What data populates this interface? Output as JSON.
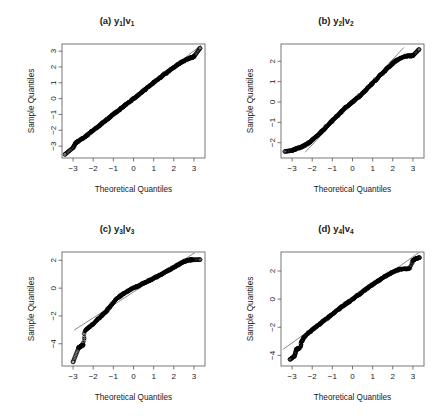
{
  "figure": {
    "title": "",
    "background": "#ffffff",
    "panel_count": 4,
    "shared_xlabel": "Theoretical Quantiles",
    "shared_ylabel": "Sample Quantiles"
  },
  "chart_data": [
    {
      "type": "scatter",
      "id": "a",
      "title": "(a) y1|v1",
      "title_main": "(a) y",
      "title_sub1": "1",
      "title_mid": "|v",
      "title_sub2": "1",
      "xlabel": "Theoretical Quantiles",
      "ylabel": "Sample Quantiles",
      "xlim": [
        -3.55,
        3.55
      ],
      "ylim": [
        -3.75,
        3.45
      ],
      "xticks": [
        -3,
        -2,
        -1,
        0,
        1,
        2,
        3
      ],
      "xticklabels": [
        "-3",
        "-2",
        "-1",
        "0",
        "1",
        "2",
        "3"
      ],
      "yticks": [
        -3,
        -2,
        -1,
        0,
        1,
        2,
        3
      ],
      "yticklabels": [
        "-3",
        "-2",
        "-1",
        "0",
        "1",
        "2",
        "3"
      ],
      "grid": false,
      "legend": false,
      "reference_line": {
        "slope": 1.0,
        "intercept": 0.02,
        "x0": -3.4,
        "x1": 3.35
      },
      "shape": "near-normal",
      "n_points": 600,
      "x": [
        -3.4,
        -3.0,
        -2.86,
        -2.78,
        -2.72,
        -2.6,
        -2.5,
        -2.4,
        -2.3,
        -2.2,
        -2.1,
        -2.0,
        -1.9,
        -1.8,
        -1.7,
        -1.6,
        -1.5,
        -1.4,
        -1.3,
        -1.2,
        -1.1,
        -1.0,
        -0.9,
        -0.8,
        -0.7,
        -0.6,
        -0.5,
        -0.4,
        -0.3,
        -0.2,
        -0.1,
        0.0,
        0.1,
        0.2,
        0.3,
        0.4,
        0.5,
        0.6,
        0.7,
        0.8,
        0.9,
        1.0,
        1.1,
        1.2,
        1.3,
        1.4,
        1.5,
        1.6,
        1.7,
        1.8,
        1.9,
        2.0,
        2.1,
        2.2,
        2.3,
        2.4,
        2.5,
        2.62,
        2.72,
        2.8,
        2.9,
        3.0,
        3.3
      ],
      "y": [
        -3.52,
        -3.1,
        -2.78,
        -2.72,
        -2.66,
        -2.58,
        -2.5,
        -2.4,
        -2.3,
        -2.2,
        -2.1,
        -2.0,
        -1.9,
        -1.8,
        -1.7,
        -1.6,
        -1.5,
        -1.4,
        -1.3,
        -1.2,
        -1.1,
        -1.0,
        -0.9,
        -0.8,
        -0.7,
        -0.6,
        -0.5,
        -0.4,
        -0.3,
        -0.2,
        -0.1,
        0.0,
        0.1,
        0.2,
        0.3,
        0.4,
        0.5,
        0.6,
        0.7,
        0.8,
        0.9,
        1.0,
        1.1,
        1.2,
        1.3,
        1.4,
        1.5,
        1.6,
        1.7,
        1.79,
        1.88,
        1.97,
        2.06,
        2.15,
        2.23,
        2.31,
        2.38,
        2.46,
        2.52,
        2.56,
        2.6,
        2.65,
        3.18
      ]
    },
    {
      "type": "scatter",
      "id": "b",
      "title": "(b) y2|v2",
      "title_main": "(b) y",
      "title_sub1": "2",
      "title_mid": "|v",
      "title_sub2": "2",
      "xlabel": "Theoretical Quantiles",
      "ylabel": "Sample Quantiles",
      "xlim": [
        -3.55,
        3.55
      ],
      "ylim": [
        -2.75,
        2.85
      ],
      "xticks": [
        -3,
        -2,
        -1,
        0,
        1,
        2,
        3
      ],
      "xticklabels": [
        "-3",
        "-2",
        "-1",
        "0",
        "1",
        "2",
        "3"
      ],
      "yticks": [
        -2,
        -1,
        0,
        1,
        2
      ],
      "yticklabels": [
        "-2",
        "-1",
        "0",
        "1",
        "2"
      ],
      "grid": false,
      "legend": false,
      "reference_line": {
        "slope": 1.05,
        "intercept": 0.0,
        "x0": -2.35,
        "x1": 2.55
      },
      "shape": "short-tailed-S",
      "n_points": 600,
      "x": [
        -3.35,
        -3.0,
        -2.88,
        -2.8,
        -2.72,
        -2.62,
        -2.5,
        -2.4,
        -2.3,
        -2.2,
        -2.1,
        -2.0,
        -1.9,
        -1.8,
        -1.7,
        -1.6,
        -1.5,
        -1.4,
        -1.3,
        -1.2,
        -1.1,
        -1.0,
        -0.9,
        -0.8,
        -0.7,
        -0.6,
        -0.5,
        -0.4,
        -0.3,
        -0.2,
        -0.1,
        0.0,
        0.1,
        0.2,
        0.3,
        0.4,
        0.5,
        0.6,
        0.7,
        0.8,
        0.9,
        1.0,
        1.1,
        1.2,
        1.3,
        1.4,
        1.5,
        1.6,
        1.7,
        1.8,
        1.9,
        2.0,
        2.1,
        2.2,
        2.32,
        2.45,
        2.58,
        2.7,
        2.8,
        2.92,
        3.0,
        3.3
      ],
      "y": [
        -2.43,
        -2.38,
        -2.33,
        -2.3,
        -2.27,
        -2.24,
        -2.2,
        -2.15,
        -2.09,
        -2.02,
        -1.95,
        -1.87,
        -1.78,
        -1.69,
        -1.6,
        -1.51,
        -1.41,
        -1.32,
        -1.22,
        -1.12,
        -1.02,
        -0.92,
        -0.82,
        -0.72,
        -0.62,
        -0.52,
        -0.42,
        -0.33,
        -0.24,
        -0.16,
        -0.08,
        0.0,
        0.08,
        0.16,
        0.25,
        0.34,
        0.43,
        0.53,
        0.63,
        0.73,
        0.83,
        0.93,
        1.03,
        1.13,
        1.23,
        1.33,
        1.43,
        1.53,
        1.63,
        1.72,
        1.81,
        1.9,
        1.98,
        2.06,
        2.13,
        2.19,
        2.23,
        2.25,
        2.26,
        2.27,
        2.28,
        2.58
      ]
    },
    {
      "type": "scatter",
      "id": "c",
      "title": "(c) y3|v3",
      "title_main": "(c) y",
      "title_sub1": "3",
      "title_mid": "|v",
      "title_sub2": "3",
      "xlabel": "Theoretical Quantiles",
      "ylabel": "Sample Quantiles",
      "xlim": [
        -3.55,
        3.55
      ],
      "ylim": [
        -5.6,
        2.6
      ],
      "xticks": [
        -3,
        -2,
        -1,
        0,
        1,
        2,
        3
      ],
      "xticklabels": [
        "-3",
        "-2",
        "-1",
        "0",
        "1",
        "2",
        "3"
      ],
      "yticks": [
        -4,
        -2,
        0,
        2
      ],
      "yticklabels": [
        "-4",
        "-2",
        "0",
        "2"
      ],
      "grid": false,
      "legend": false,
      "reference_line": {
        "slope": 0.93,
        "intercept": -0.28,
        "x0": -2.95,
        "x1": 3.05
      },
      "shape": "left-skewed",
      "n_points": 600,
      "x": [
        -3.0,
        -2.72,
        -2.66,
        -2.6,
        -2.55,
        -2.5,
        -2.42,
        -2.3,
        -2.2,
        -2.1,
        -2.0,
        -1.9,
        -1.8,
        -1.7,
        -1.6,
        -1.5,
        -1.4,
        -1.3,
        -1.2,
        -1.1,
        -1.0,
        -0.9,
        -0.8,
        -0.7,
        -0.6,
        -0.5,
        -0.4,
        -0.3,
        -0.2,
        -0.1,
        0.0,
        0.1,
        0.2,
        0.3,
        0.4,
        0.5,
        0.6,
        0.7,
        0.8,
        0.9,
        1.0,
        1.1,
        1.2,
        1.3,
        1.4,
        1.5,
        1.6,
        1.7,
        1.8,
        1.9,
        2.0,
        2.1,
        2.2,
        2.3,
        2.4,
        2.5,
        2.62,
        2.72,
        2.82,
        2.92,
        3.3
      ],
      "y": [
        -5.3,
        -4.28,
        -4.22,
        -4.16,
        -4.12,
        -4.08,
        -3.05,
        -2.92,
        -2.8,
        -2.68,
        -2.55,
        -2.42,
        -2.28,
        -2.14,
        -2.0,
        -1.86,
        -1.72,
        -1.56,
        -1.38,
        -1.2,
        -1.02,
        -0.86,
        -0.72,
        -0.6,
        -0.49,
        -0.39,
        -0.3,
        -0.22,
        -0.14,
        -0.07,
        0.0,
        0.07,
        0.14,
        0.21,
        0.28,
        0.35,
        0.42,
        0.49,
        0.56,
        0.63,
        0.7,
        0.77,
        0.85,
        0.93,
        1.01,
        1.09,
        1.17,
        1.25,
        1.33,
        1.41,
        1.5,
        1.58,
        1.67,
        1.75,
        1.83,
        1.9,
        1.97,
        2.01,
        2.03,
        2.04,
        2.05
      ]
    },
    {
      "type": "scatter",
      "id": "d",
      "title": "(d) y4|v4",
      "title_main": "(d) y",
      "title_sub1": "4",
      "title_mid": "|v",
      "title_sub2": "4",
      "xlabel": "Theoretical Quantiles",
      "ylabel": "Sample Quantiles",
      "xlim": [
        -3.55,
        3.55
      ],
      "ylim": [
        -4.75,
        3.35
      ],
      "xticks": [
        -3,
        -2,
        -1,
        0,
        1,
        2,
        3
      ],
      "xticklabels": [
        "-3",
        "-2",
        "-1",
        "0",
        "1",
        "2",
        "3"
      ],
      "yticks": [
        -4,
        -2,
        0,
        2
      ],
      "yticklabels": [
        "-4",
        "-2",
        "0",
        "2"
      ],
      "grid": false,
      "legend": false,
      "reference_line": {
        "slope": 1.02,
        "intercept": -0.05,
        "x0": -3.45,
        "x1": 3.35
      },
      "shape": "near-normal-slight-skew",
      "n_points": 600,
      "x": [
        -3.1,
        -2.88,
        -2.78,
        -2.7,
        -2.62,
        -2.55,
        -2.48,
        -2.4,
        -2.3,
        -2.2,
        -2.1,
        -2.0,
        -1.9,
        -1.8,
        -1.7,
        -1.6,
        -1.5,
        -1.4,
        -1.3,
        -1.2,
        -1.1,
        -1.0,
        -0.9,
        -0.8,
        -0.7,
        -0.6,
        -0.5,
        -0.4,
        -0.3,
        -0.2,
        -0.1,
        0.0,
        0.1,
        0.2,
        0.3,
        0.4,
        0.5,
        0.6,
        0.7,
        0.8,
        0.9,
        1.0,
        1.1,
        1.2,
        1.3,
        1.4,
        1.5,
        1.6,
        1.7,
        1.8,
        1.9,
        2.0,
        2.1,
        2.2,
        2.3,
        2.45,
        2.6,
        2.72,
        2.84,
        3.0,
        3.15,
        3.32
      ],
      "y": [
        -4.28,
        -4.05,
        -3.55,
        -3.52,
        -3.48,
        -3.1,
        -2.9,
        -2.7,
        -2.55,
        -2.42,
        -2.3,
        -2.18,
        -2.06,
        -1.95,
        -1.84,
        -1.73,
        -1.62,
        -1.51,
        -1.4,
        -1.29,
        -1.18,
        -1.07,
        -0.96,
        -0.85,
        -0.74,
        -0.63,
        -0.52,
        -0.41,
        -0.31,
        -0.21,
        -0.11,
        0.0,
        0.11,
        0.21,
        0.31,
        0.41,
        0.51,
        0.62,
        0.73,
        0.84,
        0.95,
        1.05,
        1.14,
        1.23,
        1.32,
        1.41,
        1.5,
        1.59,
        1.68,
        1.76,
        1.84,
        1.92,
        1.99,
        2.05,
        2.1,
        2.13,
        2.15,
        2.17,
        2.18,
        2.75,
        2.88,
        2.95
      ]
    }
  ]
}
